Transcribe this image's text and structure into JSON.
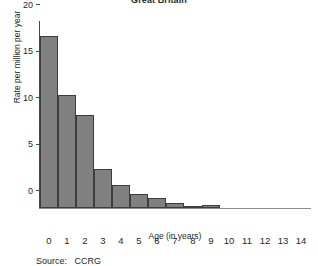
{
  "chart_data": {
    "type": "bar",
    "title": "Great Britain",
    "xlabel": "Age (in years)",
    "ylabel": "Rate per million per year",
    "categories": [
      "0",
      "1",
      "2",
      "3",
      "4",
      "5",
      "6",
      "7",
      "8",
      "9",
      "10",
      "11",
      "12",
      "13",
      "14"
    ],
    "values": [
      18.5,
      12.1,
      10.0,
      4.2,
      2.5,
      1.5,
      1.1,
      0.5,
      0.2,
      0.3,
      0.0,
      0.0,
      0.0,
      0.0,
      0.0
    ],
    "xlim": [
      0,
      15
    ],
    "ylim": [
      0,
      20
    ],
    "ytick_labels": [
      "0",
      "5",
      "10",
      "15",
      "20"
    ],
    "ytick_values": [
      0,
      5,
      10,
      15,
      20
    ],
    "grid": false,
    "legend": null,
    "bar_style": "histogram-adjacent",
    "colors": {
      "bar_fill": "#808080",
      "bar_edge": "#3d3d3d",
      "axis": "#4a4a4a",
      "text": "#1f1f1f"
    }
  },
  "notes": {
    "source_label": "Source:",
    "source_value": "CCRG"
  }
}
